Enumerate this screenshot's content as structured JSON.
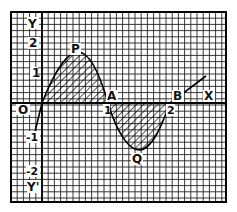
{
  "diagram": {
    "type": "graph-paper-curve",
    "axes": {
      "x_label": "X",
      "y_label": "Y",
      "y_neg_label": "Y'",
      "origin_label": "O"
    },
    "x_ticks": [
      {
        "value": 1,
        "label": "1"
      },
      {
        "value": 2,
        "label": "2"
      }
    ],
    "y_ticks": [
      {
        "value": 2,
        "label": "2"
      },
      {
        "value": 1,
        "label": "1"
      },
      {
        "value": -1,
        "label": "-1"
      },
      {
        "value": -2,
        "label": "-2"
      }
    ],
    "points": [
      {
        "name": "P",
        "label": "P",
        "x": 0.5,
        "y": 1.6
      },
      {
        "name": "A",
        "label": "A",
        "x": 1,
        "y": 0
      },
      {
        "name": "Q",
        "label": "Q",
        "x": 1.5,
        "y": -1.6
      },
      {
        "name": "B",
        "label": "B",
        "x": 2,
        "y": 0
      }
    ],
    "shaded_regions": [
      {
        "between": "O-A",
        "side": "above x-axis"
      },
      {
        "between": "A-B",
        "side": "below x-axis"
      }
    ],
    "colors": {
      "grid": "#222222",
      "curve": "#000000",
      "background": "#ffffff"
    }
  }
}
